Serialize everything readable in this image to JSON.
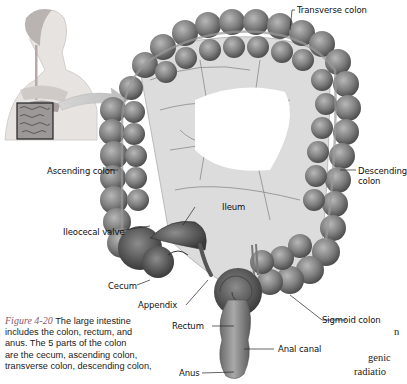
{
  "figure": {
    "number": "Figure 4-20",
    "caption_lines": [
      "The large intestine",
      "includes the colon, rectum, and",
      "anus. The 5 parts of the colon",
      "are the cecum, ascending colon,",
      "transverse colon, descending colon,"
    ]
  },
  "labels": {
    "transverse_colon": "Transverse colon",
    "ascending_colon": "Ascending colon",
    "descending_colon_1": "Descending",
    "descending_colon_2": "colon",
    "ileum": "Ileum",
    "ileocecal_valve": "Ileocecal valve",
    "cecum": "Cecum",
    "appendix": "Appendix",
    "rectum": "Rectum",
    "sigmoid_colon": "Sigmoid colon",
    "anal_canal": "Anal canal",
    "anus": "Anus"
  },
  "cutoff_text": {
    "line1": "n",
    "line2": "genic",
    "line3": "radiatio"
  },
  "inset": {
    "subject": "human torso with digestive system, boxed intestine region"
  },
  "colors": {
    "colon_fill": "#8a8a8a",
    "colon_dark": "#555555",
    "mesentery": "#d8d8d8",
    "figure_label": "#8a5a6a"
  }
}
